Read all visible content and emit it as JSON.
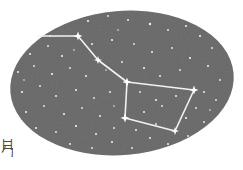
{
  "figure": {
    "caption_glyph": "目\n勹",
    "sky": {
      "fill_color": "#686868",
      "noise_color": "#5e5e5e",
      "shape": "ellipse",
      "center_x": 122,
      "center_y": 83,
      "radius_x": 112,
      "radius_y": 72,
      "rotation_deg": -5
    },
    "line_color": "#f2f2f2",
    "star_color": "#ffffff"
  },
  "chart_data": {
    "type": "scatter",
    "xlabel": "",
    "ylabel": "",
    "named_stars": [
      {
        "name": "handle-end",
        "x": 34,
        "y": 36,
        "size": 9
      },
      {
        "name": "handle-mid",
        "x": 78,
        "y": 36,
        "size": 9
      },
      {
        "name": "handle-inner",
        "x": 98,
        "y": 60,
        "size": 8
      },
      {
        "name": "bowl-top-left",
        "x": 127,
        "y": 82,
        "size": 9
      },
      {
        "name": "bowl-top-right",
        "x": 194,
        "y": 90,
        "size": 9
      },
      {
        "name": "bowl-bottom-left",
        "x": 125,
        "y": 118,
        "size": 9
      },
      {
        "name": "bowl-bottom-right",
        "x": 175,
        "y": 131,
        "size": 8
      }
    ],
    "asterism_lines": [
      {
        "from": "handle-end",
        "to": "handle-mid"
      },
      {
        "from": "handle-mid",
        "to": "handle-inner"
      },
      {
        "from": "handle-inner",
        "to": "bowl-top-left"
      },
      {
        "from": "bowl-top-left",
        "to": "bowl-top-right"
      },
      {
        "from": "bowl-top-right",
        "to": "bowl-bottom-right"
      },
      {
        "from": "bowl-bottom-right",
        "to": "bowl-bottom-left"
      },
      {
        "from": "bowl-bottom-left",
        "to": "bowl-top-left"
      }
    ],
    "background_stars": [
      {
        "x": 46,
        "y": 24,
        "r": 1.0
      },
      {
        "x": 60,
        "y": 18,
        "r": 0.8
      },
      {
        "x": 88,
        "y": 21,
        "r": 1.1
      },
      {
        "x": 108,
        "y": 16,
        "r": 0.9
      },
      {
        "x": 128,
        "y": 20,
        "r": 1.0
      },
      {
        "x": 150,
        "y": 24,
        "r": 1.2
      },
      {
        "x": 168,
        "y": 30,
        "r": 0.9
      },
      {
        "x": 186,
        "y": 26,
        "r": 1.0
      },
      {
        "x": 200,
        "y": 36,
        "r": 1.1
      },
      {
        "x": 212,
        "y": 48,
        "r": 0.9
      },
      {
        "x": 30,
        "y": 54,
        "r": 1.0
      },
      {
        "x": 48,
        "y": 46,
        "r": 0.9
      },
      {
        "x": 62,
        "y": 56,
        "r": 1.1
      },
      {
        "x": 74,
        "y": 50,
        "r": 0.8
      },
      {
        "x": 92,
        "y": 44,
        "r": 1.0
      },
      {
        "x": 112,
        "y": 40,
        "r": 1.1
      },
      {
        "x": 134,
        "y": 44,
        "r": 0.9
      },
      {
        "x": 152,
        "y": 52,
        "r": 1.0
      },
      {
        "x": 172,
        "y": 48,
        "r": 0.9
      },
      {
        "x": 190,
        "y": 58,
        "r": 1.1
      },
      {
        "x": 208,
        "y": 66,
        "r": 1.0
      },
      {
        "x": 220,
        "y": 80,
        "r": 0.9
      },
      {
        "x": 18,
        "y": 72,
        "r": 1.0
      },
      {
        "x": 34,
        "y": 66,
        "r": 0.9
      },
      {
        "x": 52,
        "y": 74,
        "r": 1.1
      },
      {
        "x": 70,
        "y": 68,
        "r": 0.9
      },
      {
        "x": 86,
        "y": 76,
        "r": 1.0
      },
      {
        "x": 106,
        "y": 70,
        "r": 0.8
      },
      {
        "x": 122,
        "y": 62,
        "r": 0.9
      },
      {
        "x": 144,
        "y": 68,
        "r": 1.1
      },
      {
        "x": 160,
        "y": 76,
        "r": 1.0
      },
      {
        "x": 180,
        "y": 70,
        "r": 0.9
      },
      {
        "x": 204,
        "y": 92,
        "r": 1.0
      },
      {
        "x": 216,
        "y": 100,
        "r": 0.9
      },
      {
        "x": 22,
        "y": 92,
        "r": 1.1
      },
      {
        "x": 40,
        "y": 86,
        "r": 0.9
      },
      {
        "x": 56,
        "y": 96,
        "r": 1.0
      },
      {
        "x": 76,
        "y": 90,
        "r": 1.1
      },
      {
        "x": 94,
        "y": 98,
        "r": 0.9
      },
      {
        "x": 110,
        "y": 92,
        "r": 1.0
      },
      {
        "x": 140,
        "y": 92,
        "r": 0.9
      },
      {
        "x": 156,
        "y": 100,
        "r": 1.1
      },
      {
        "x": 176,
        "y": 96,
        "r": 1.0
      },
      {
        "x": 196,
        "y": 108,
        "r": 0.9
      },
      {
        "x": 26,
        "y": 112,
        "r": 1.0
      },
      {
        "x": 44,
        "y": 106,
        "r": 0.9
      },
      {
        "x": 64,
        "y": 114,
        "r": 1.1
      },
      {
        "x": 82,
        "y": 108,
        "r": 0.9
      },
      {
        "x": 100,
        "y": 116,
        "r": 1.0
      },
      {
        "x": 114,
        "y": 106,
        "r": 0.8
      },
      {
        "x": 144,
        "y": 112,
        "r": 1.0
      },
      {
        "x": 162,
        "y": 106,
        "r": 0.9
      },
      {
        "x": 186,
        "y": 118,
        "r": 1.1
      },
      {
        "x": 204,
        "y": 122,
        "r": 0.9
      },
      {
        "x": 36,
        "y": 128,
        "r": 1.0
      },
      {
        "x": 56,
        "y": 132,
        "r": 0.9
      },
      {
        "x": 76,
        "y": 126,
        "r": 1.1
      },
      {
        "x": 96,
        "y": 134,
        "r": 1.0
      },
      {
        "x": 114,
        "y": 128,
        "r": 0.9
      },
      {
        "x": 136,
        "y": 130,
        "r": 1.0
      },
      {
        "x": 156,
        "y": 124,
        "r": 0.9
      },
      {
        "x": 168,
        "y": 144,
        "r": 1.0
      },
      {
        "x": 188,
        "y": 136,
        "r": 0.9
      },
      {
        "x": 70,
        "y": 144,
        "r": 1.0
      },
      {
        "x": 92,
        "y": 148,
        "r": 0.9
      },
      {
        "x": 112,
        "y": 142,
        "r": 1.0
      },
      {
        "x": 132,
        "y": 148,
        "r": 0.9
      },
      {
        "x": 150,
        "y": 138,
        "r": 1.0
      },
      {
        "x": 50,
        "y": 36,
        "r": 0.8
      },
      {
        "x": 118,
        "y": 30,
        "r": 0.8
      },
      {
        "x": 176,
        "y": 16,
        "r": 0.8
      },
      {
        "x": 24,
        "y": 80,
        "r": 0.8
      },
      {
        "x": 210,
        "y": 110,
        "r": 0.8
      }
    ]
  }
}
